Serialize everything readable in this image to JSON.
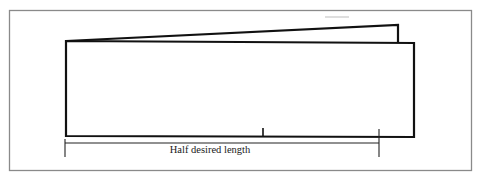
{
  "figure": {
    "dimension_label": "Half desired length",
    "colors": {
      "line": "#111111",
      "frame": "#8a8a8a",
      "background": "#ffffff"
    }
  }
}
